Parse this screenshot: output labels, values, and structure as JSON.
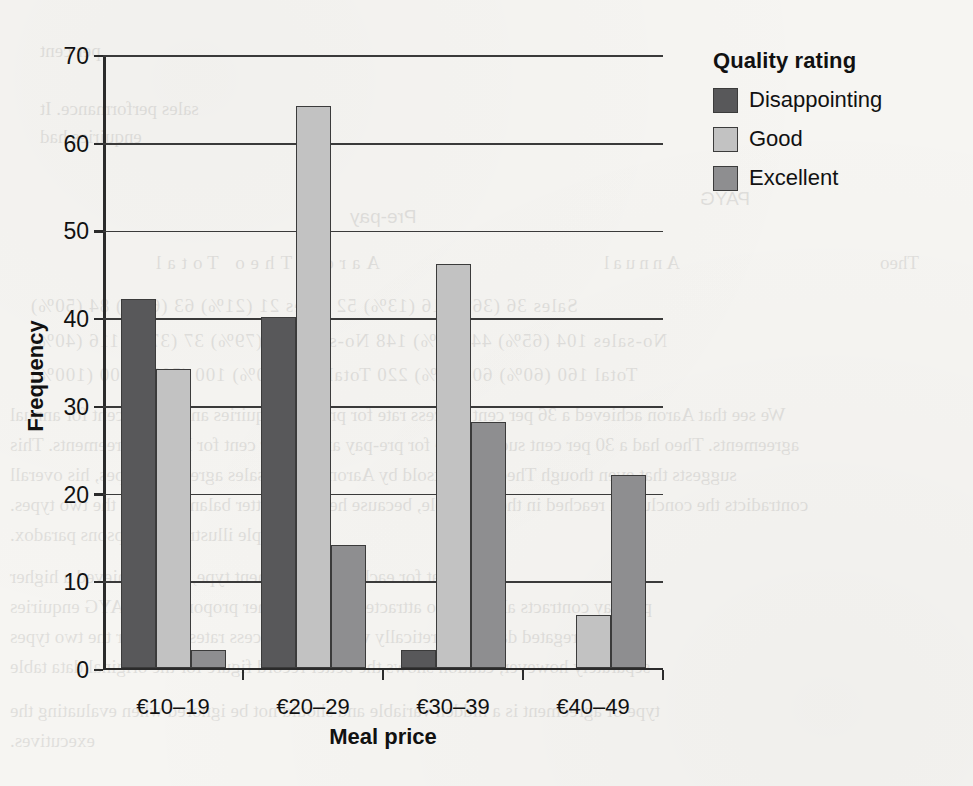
{
  "chart_data": {
    "type": "bar",
    "title": "",
    "xlabel": "Meal price",
    "ylabel": "Frequency",
    "categories": [
      "€10–19",
      "€20–29",
      "€30–39",
      "€40–49"
    ],
    "series": [
      {
        "name": "Disappointing",
        "color": "#58585a",
        "values": [
          42,
          40,
          2,
          0
        ]
      },
      {
        "name": "Good",
        "color": "#c2c2c2",
        "values": [
          34,
          64,
          46,
          6
        ]
      },
      {
        "name": "Excellent",
        "color": "#8e8e90",
        "values": [
          2,
          14,
          28,
          22
        ]
      }
    ],
    "ylim": [
      0,
      70
    ],
    "yticks": [
      0,
      10,
      20,
      30,
      40,
      50,
      60,
      70
    ],
    "ytick_labels": [
      "0",
      "10",
      "20",
      "30",
      "40",
      "50",
      "60",
      "70"
    ],
    "grid": "horizontal",
    "legend": {
      "title": "Quality rating",
      "position": "right"
    }
  },
  "legend": {
    "title": "Quality rating",
    "items": [
      {
        "label": "Disappointing"
      },
      {
        "label": "Good"
      },
      {
        "label": "Excellent"
      }
    ]
  },
  "background_text": {
    "lines": [
      "per cent",
      "sales performance. It",
      "enquiries had",
      "PAYG",
      "Pre-pay",
      "Aaron      Theo      Total",
      "Annual",
      "Theo",
      "Sales      36 (36%)   16 (13%)   52      Sales      21 (21%)   63 (63%)   84 (50%)",
      "No-sales   104 (65%)  44 (55%)   148     No-sales   79 (79%)   37 (37%)   116 (40%)",
      "Total      160 (60%)  60 (40%)   220     Total      100 (50%)  100 (50%)  200 (100%)",
      "We see that Aaron achieved a 36 per cent success rate for pre-pay enquiries and 65 per cent for annual",
      "agreements. Theo had a 30 per cent success rate for pre-pay and 63 per cent for PAYG agreements. This",
      "suggests that even though Theo was outsold by Aaron in both sales agreement types, his overall",
      "contradicts the conclusion reached in the first table, because he had a better balance across the two types.",
      "example illustrates Simpsons paradox.",
      "Note that for each sales agreement type, Theo achieved a higher",
      "pre-pay contracts alone. Theo attracted a much higher proportion of PAYG enquiries",
      "aggregated data. Theoretically we look at success rates taken for the two types",
      "separately however, caution shows the better record figure for the original data table",
      "type of agreement is a hidden variable and should not be ignored when evaluating the",
      "executives."
    ]
  }
}
